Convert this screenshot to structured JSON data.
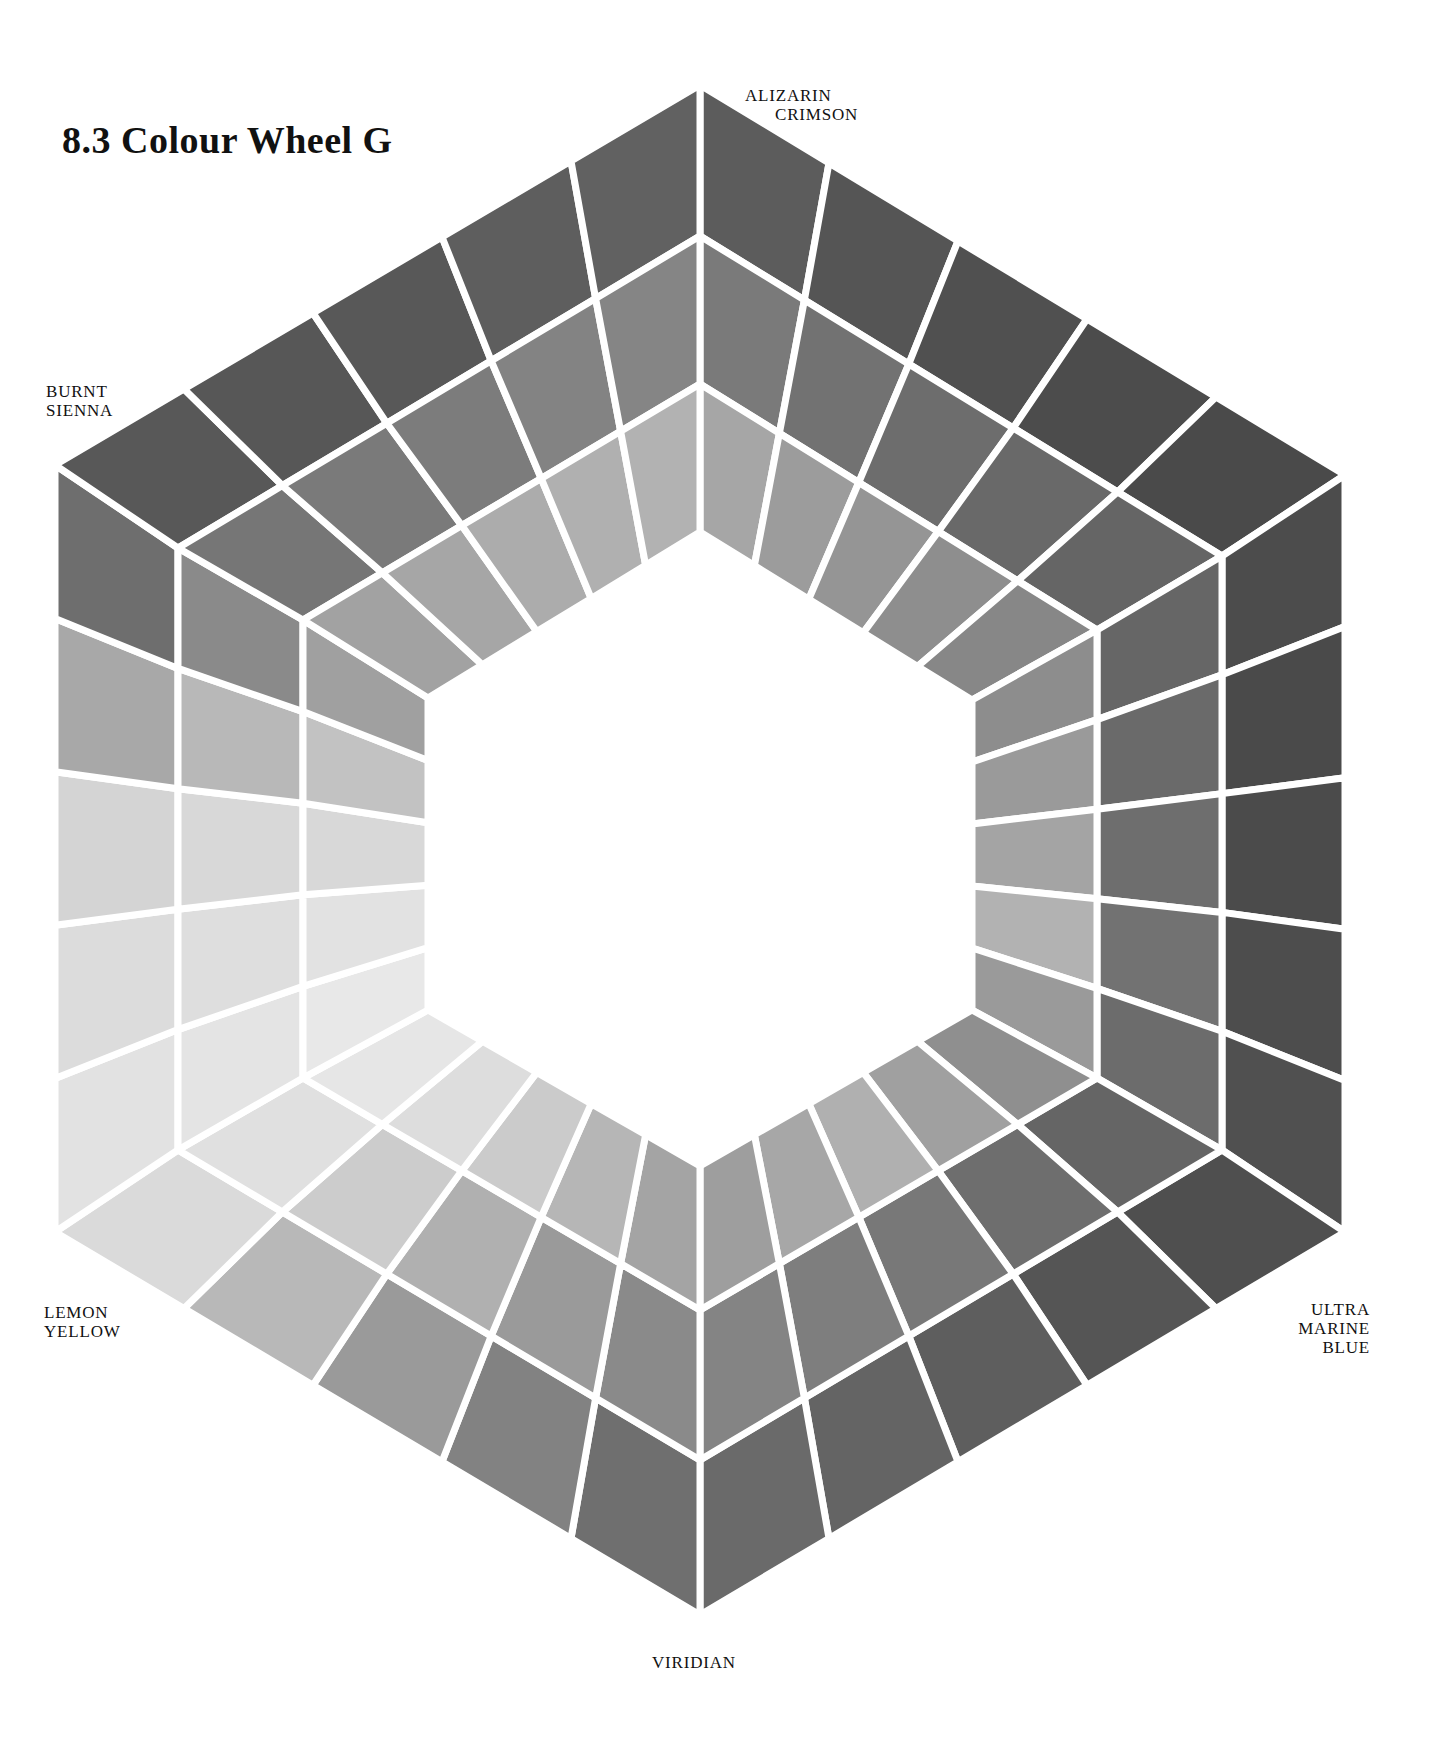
{
  "page": {
    "title": "8.3 Colour Wheel G"
  },
  "labels": {
    "alizarin": [
      "ALIZARIN",
      "CRIMSON"
    ],
    "burnt_sienna": [
      "BURNT",
      "SIENNA"
    ],
    "lemon_yellow": [
      "LEMON",
      "YELLOW"
    ],
    "ultramarine": [
      "ULTRA",
      "MARINE",
      "BLUE"
    ],
    "viridian": [
      "VIRIDIAN"
    ]
  },
  "wheel": {
    "outer_vertices": [
      [
        700,
        85
      ],
      [
        1345,
        475
      ],
      [
        1345,
        1232
      ],
      [
        700,
        1615
      ],
      [
        55,
        1232
      ],
      [
        55,
        465
      ]
    ],
    "mid1_vertices": [
      [
        700,
        236
      ],
      [
        1222,
        556
      ],
      [
        1222,
        1150
      ],
      [
        700,
        1460
      ],
      [
        178,
        1150
      ],
      [
        178,
        548
      ]
    ],
    "mid2_vertices": [
      [
        700,
        384
      ],
      [
        1097,
        630
      ],
      [
        1097,
        1078
      ],
      [
        700,
        1310
      ],
      [
        303,
        1078
      ],
      [
        303,
        620
      ]
    ],
    "inner_vertices": [
      [
        700,
        532
      ],
      [
        972,
        700
      ],
      [
        972,
        1010
      ],
      [
        700,
        1166
      ],
      [
        428,
        1010
      ],
      [
        428,
        698
      ]
    ],
    "columns_per_side": 5,
    "gap_color": "#ffffff",
    "sides": [
      {
        "name": "alizarin-to-ultramarine-upper",
        "rings": [
          [
            "#5c5c5c",
            "#555555",
            "#505050",
            "#4c4c4c",
            "#4a4a4a"
          ],
          [
            "#7a7a7a",
            "#727272",
            "#6d6d6d",
            "#696969",
            "#656565"
          ],
          [
            "#a6a6a6",
            "#9c9c9c",
            "#959595",
            "#8e8e8e",
            "#878787"
          ]
        ]
      },
      {
        "name": "ultramarine-side",
        "rings": [
          [
            "#4c4c4c",
            "#4a4a4a",
            "#4b4b4b",
            "#4d4d4d",
            "#505050"
          ],
          [
            "#666666",
            "#6a6a6a",
            "#6e6e6e",
            "#727272",
            "#6c6c6c"
          ],
          [
            "#8d8d8d",
            "#9a9a9a",
            "#a4a4a4",
            "#b2b2b2",
            "#9a9a9a"
          ]
        ]
      },
      {
        "name": "ultramarine-to-viridian",
        "rings": [
          [
            "#4f4f4f",
            "#555555",
            "#5e5e5e",
            "#646464",
            "#6a6a6a"
          ],
          [
            "#656565",
            "#6e6e6e",
            "#787878",
            "#7e7e7e",
            "#848484"
          ],
          [
            "#8f8f8f",
            "#a0a0a0",
            "#b0b0b0",
            "#a7a7a7",
            "#9e9e9e"
          ]
        ]
      },
      {
        "name": "viridian-to-lemon",
        "rings": [
          [
            "#6f6f6f",
            "#828282",
            "#9a9a9a",
            "#b8b8b8",
            "#dadada"
          ],
          [
            "#8a8a8a",
            "#9a9a9a",
            "#b0b0b0",
            "#cccccc",
            "#e0e0e0"
          ],
          [
            "#a4a4a4",
            "#b6b6b6",
            "#cbcbcb",
            "#dddddd",
            "#e6e6e6"
          ]
        ]
      },
      {
        "name": "lemon-side",
        "rings": [
          [
            "#e2e2e2",
            "#dcdcdc",
            "#d4d4d4",
            "#a8a8a8",
            "#6e6e6e"
          ],
          [
            "#e4e4e4",
            "#dedede",
            "#d8d8d8",
            "#b8b8b8",
            "#8a8a8a"
          ],
          [
            "#e8e8e8",
            "#e2e2e2",
            "#d8d8d8",
            "#c2c2c2",
            "#a0a0a0"
          ]
        ]
      },
      {
        "name": "burnt-sienna-to-alizarin",
        "rings": [
          [
            "#585858",
            "#575757",
            "#585858",
            "#5e5e5e",
            "#616161"
          ],
          [
            "#767676",
            "#7a7a7a",
            "#7c7c7c",
            "#838383",
            "#858585"
          ],
          [
            "#a2a2a2",
            "#a6a6a6",
            "#acacac",
            "#b0b0b0",
            "#b2b2b2"
          ]
        ]
      }
    ]
  }
}
